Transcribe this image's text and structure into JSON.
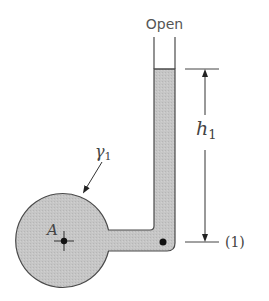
{
  "diagram": {
    "type": "piezometer-tube",
    "labels": {
      "open": "Open",
      "height_symbol": "h",
      "height_subscript": "1",
      "specific_weight_symbol": "γ",
      "specific_weight_subscript": "1",
      "point_a": "A",
      "level_marker": "(1)"
    },
    "colors": {
      "fluid_fill": "#c4c4c4",
      "outline": "#555555",
      "dimension_line": "#333333",
      "point_marker": "#111111",
      "background": "#ffffff"
    },
    "elements": {
      "container": "circular-vessel",
      "connector": "horizontal-tube",
      "column": "vertical-open-tube",
      "measurement_point": "dot-at-level-1",
      "dimension": "h1-arrow-from-level-1-to-fluid-surface"
    }
  }
}
